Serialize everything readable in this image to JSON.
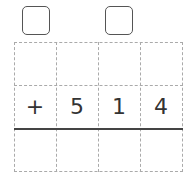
{
  "carry_boxes": [
    {
      "position": 1,
      "value": ""
    },
    {
      "position": 3,
      "value": ""
    }
  ],
  "rows": [
    [
      "",
      "",
      "",
      ""
    ],
    [
      "+",
      "5",
      "1",
      "4"
    ],
    [
      "",
      "",
      "",
      ""
    ]
  ],
  "operator": "+",
  "addend": "514"
}
